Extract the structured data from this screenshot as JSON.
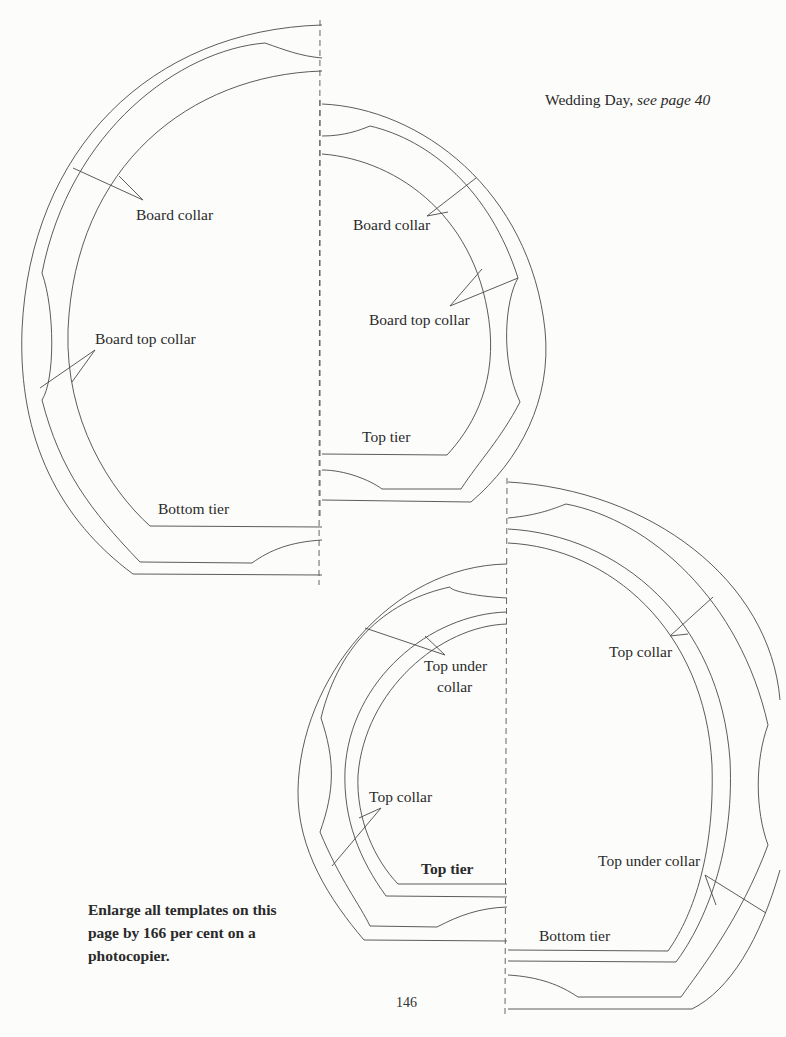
{
  "page": {
    "title_main": "Wedding Day,",
    "title_ref": "see page 40",
    "page_number": "146",
    "instruction": "Enlarge all templates on this page by 166 per cent on a photocopier."
  },
  "templates": {
    "board": {
      "labels": {
        "board_collar_left": "Board collar",
        "board_top_collar_left": "Board top collar",
        "bottom_tier": "Bottom tier",
        "board_collar_right": "Board collar",
        "board_top_collar_right": "Board top collar",
        "top_tier": "Top tier"
      }
    },
    "cake": {
      "labels": {
        "top_under_collar_left_line1": "Top under",
        "top_under_collar_left_line2": "collar",
        "top_collar_left": "Top collar",
        "top_tier": "Top tier",
        "top_collar_right": "Top collar",
        "top_under_collar_right": "Top under collar",
        "bottom_tier": "Bottom tier"
      }
    }
  },
  "colors": {
    "line": "#4a4a4a",
    "paper": "#fcfcfb",
    "text": "#2a2a2a"
  }
}
